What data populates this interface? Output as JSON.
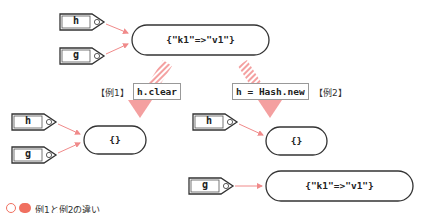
{
  "diagram": {
    "top": {
      "tags": [
        {
          "label": "h"
        },
        {
          "label": "g"
        }
      ],
      "hash_value": "{\"k1\"=>\"v1\"}"
    },
    "example1": {
      "label": "【例1】",
      "code": "h.clear",
      "tags": [
        {
          "label": "h"
        },
        {
          "label": "g"
        }
      ],
      "hash_value": "{}"
    },
    "example2": {
      "label": "【例2】",
      "code": "h = Hash.new",
      "tags": [
        {
          "label": "h"
        },
        {
          "label": "g"
        }
      ],
      "hash_h": "{}",
      "hash_g": "{\"k1\"=>\"v1\"}"
    },
    "caption": {
      "badge": "",
      "text": "例1と例2の違い"
    },
    "colors": {
      "arrow": "#f08a8a",
      "stroke": "#333333",
      "badge": "#f07060"
    }
  }
}
